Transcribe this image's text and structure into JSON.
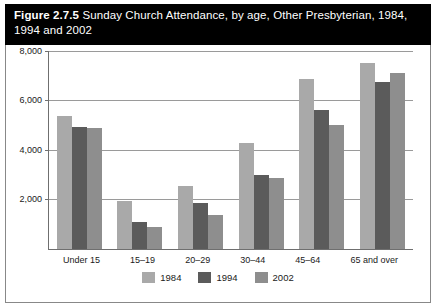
{
  "title": {
    "label": "Figure 2.7.5",
    "text": " Sunday Church Attendance, by age, Other Presbyterian, 1984, 1994 and 2002"
  },
  "chart_data": {
    "type": "bar",
    "title": "Sunday Church Attendance, by age, Other Presbyterian, 1984, 1994 and 2002",
    "categories": [
      "Under 15",
      "15–19",
      "20–29",
      "30–44",
      "45–64",
      "65 and over"
    ],
    "series": [
      {
        "name": "1984",
        "color": "#a9a9a9",
        "values": [
          5400,
          1950,
          2550,
          4300,
          6900,
          7550
        ]
      },
      {
        "name": "1994",
        "color": "#5b5b5b",
        "values": [
          4950,
          1100,
          1850,
          3000,
          5650,
          6800
        ]
      },
      {
        "name": "2002",
        "color": "#8e8e8e",
        "values": [
          4900,
          900,
          1400,
          2900,
          5050,
          7150
        ]
      }
    ],
    "xlabel": "",
    "ylabel": "",
    "ylim": [
      0,
      8000
    ],
    "yticks": [
      2000,
      4000,
      6000,
      8000
    ],
    "ytick_labels": [
      "2,000",
      "4,000",
      "6,000",
      "8,000"
    ],
    "grid": true,
    "legend_position": "bottom"
  }
}
